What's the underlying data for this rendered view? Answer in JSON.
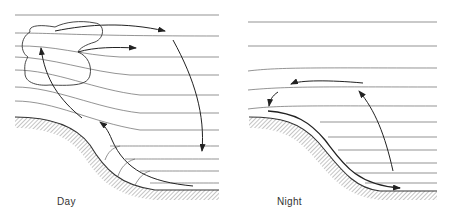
{
  "figure": {
    "panels": [
      {
        "id": "day",
        "label": "Day",
        "description": "Daytime upslope (anabatic) wind circulation with cumulus cloud over ridge; return flow aloft and subsidence over valley"
      },
      {
        "id": "night",
        "label": "Night",
        "description": "Nighttime downslope (katabatic) drainage flow along slope; compensating upward/return flow aloft"
      }
    ],
    "colors": {
      "line": "#555555",
      "arrow": "#222222",
      "ground_hatch": "#777777",
      "background": "#ffffff"
    }
  }
}
